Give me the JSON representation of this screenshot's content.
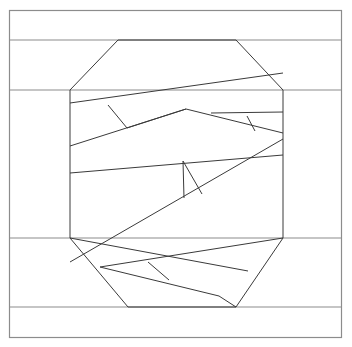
{
  "figure": {
    "type": "line-art",
    "background_color": "#ffffff",
    "line_color": "#3a3a3a",
    "frame_color": "#8c8c8c",
    "width": 352,
    "height": 347
  },
  "frame": {
    "name": "outer-border",
    "x": 9.5,
    "y": 10.5,
    "width": 332,
    "height": 327
  },
  "bands": {
    "name": "horizontal-band-lines",
    "y_values": [
      40,
      90,
      238,
      307
    ],
    "x_start": 9.5,
    "x_end": 341.5
  },
  "octagon": {
    "name": "central-octagon",
    "points": "118,40 236,40 283,90 283,238 236,307 128,307 70,238 70,90"
  },
  "interior_lines": [
    {
      "name": "line-upper-long-slope",
      "points": "70,103 283,73"
    },
    {
      "name": "line-upper-v-left",
      "points": "108,105 126,127"
    },
    {
      "name": "line-upper-zig-a",
      "points": "70,146 167,113 184,109"
    },
    {
      "name": "line-upper-zig-b",
      "points": "184,109 240,120 283,132"
    },
    {
      "name": "line-upper-right-tick",
      "points": "249,115 254,130"
    },
    {
      "name": "line-upper-right-band",
      "points": "212,114 283,112"
    },
    {
      "name": "line-mid-slope-a",
      "points": "70,260 283,140"
    },
    {
      "name": "line-mid-upper",
      "points": "70,261 283,136"
    },
    {
      "name": "line-mid-band-top",
      "points": "70,261 283,139"
    },
    {
      "name": "line-mid-horizontal",
      "points": "70,262 283,142"
    },
    {
      "name": "line-center-band",
      "points": "70,261 283,144"
    },
    {
      "name": "line-triangle-left",
      "points": "248,236 285,236"
    },
    {
      "name": "line-lower-zig",
      "points": "98,270 220,250 283,238"
    },
    {
      "name": "line-lower-v",
      "points": "148,262 165,276"
    },
    {
      "name": "line-lower-long",
      "points": "108,277 236,307"
    }
  ],
  "polyline_sets": {
    "upper_region": {
      "name": "upper-zigzag-group",
      "lines": [
        "70,103 283,73",
        "70,146 186,109 283,133",
        "108,105 127,128",
        "211,113 283,112",
        "247,116 255,130"
      ]
    },
    "middle_region": {
      "name": "middle-zigzag-group",
      "lines": [
        "70,173 283,155",
        "70,174 283,156",
        "70,262 283,139",
        "183,161 197,197 218,191",
        "183,161 184,197"
      ]
    },
    "lower_region": {
      "name": "lower-zigzag-group",
      "lines": [
        "70,238 248,271",
        "100,267 283,238",
        "100,267 219,296",
        "148,262 168,279"
      ]
    }
  }
}
